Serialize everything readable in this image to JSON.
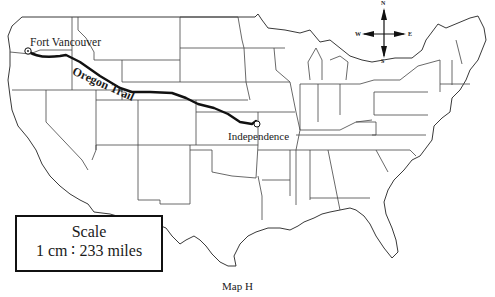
{
  "map": {
    "caption": "Map H",
    "region": "Contiguous United States (state outlines)",
    "route": {
      "name": "Oregon Trail",
      "start": "Independence",
      "end": "Fort Vancouver"
    },
    "places": [
      {
        "name": "Fort Vancouver",
        "marker": "circle"
      },
      {
        "name": "Independence",
        "marker": "circle"
      }
    ],
    "scale": {
      "title": "Scale",
      "value": "1 cm ∶ 233 miles"
    },
    "compass": {
      "north": "N",
      "south": "S",
      "east": "E",
      "west": "W"
    },
    "colors": {
      "lines": "#444444",
      "trail": "#111111",
      "background": "#ffffff"
    }
  }
}
